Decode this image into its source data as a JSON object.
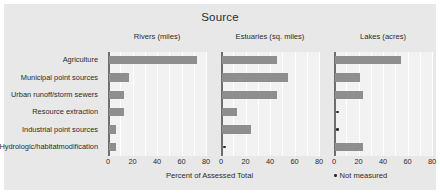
{
  "chart_data": {
    "type": "bar",
    "orientation": "horizontal",
    "title": "Source",
    "xlabel": "Percent of Assessed Total",
    "ylabel": "",
    "xlim": [
      0,
      80
    ],
    "xticks": [
      0,
      20,
      40,
      60,
      80
    ],
    "grid": true,
    "legend": {
      "position": "bottom-right",
      "marker": "dot",
      "label": "Not measured"
    },
    "categories": [
      "Agriculture",
      "Municipal point sources",
      "Urban runoff/ storm sewers",
      "Resource extraction",
      "Industrial point sources",
      "Hydrologic/habitat modification"
    ],
    "category_lines": [
      [
        "Agriculture"
      ],
      [
        "Municipal point sources"
      ],
      [
        "Urban runoff/",
        "storm sewers"
      ],
      [
        "Resource extraction"
      ],
      [
        "Industrial point sources"
      ],
      [
        "Hydrologic/habitat",
        "modification"
      ]
    ],
    "panels": [
      {
        "name": "rivers",
        "title": "Rivers (miles)",
        "values": [
          72,
          16,
          12,
          12,
          6,
          6
        ],
        "not_measured": [
          false,
          false,
          false,
          false,
          false,
          false
        ]
      },
      {
        "name": "estuaries",
        "title": "Estuaries (sq. miles)",
        "values": [
          45,
          54,
          45,
          12,
          24,
          null
        ],
        "not_measured": [
          false,
          false,
          false,
          false,
          false,
          true
        ]
      },
      {
        "name": "lakes",
        "title": "Lakes (acres)",
        "values": [
          54,
          20,
          23,
          null,
          null,
          23
        ],
        "not_measured": [
          false,
          false,
          false,
          true,
          true,
          false
        ]
      }
    ],
    "colors": {
      "bar": "#8e8e8e",
      "panel_background": "#f2f2f2",
      "figure_background": "#e8e8e8",
      "gridline": "#ffffff",
      "axis": "#6e6e6e",
      "text": "#2b2b2b"
    }
  }
}
